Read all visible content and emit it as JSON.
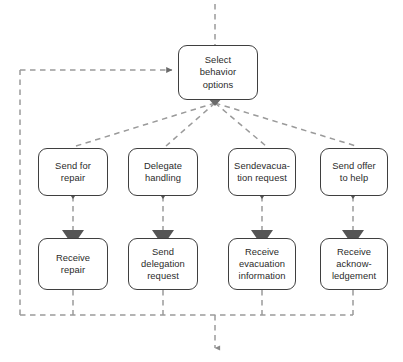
{
  "diagram": {
    "colors": {
      "node_border": "#3f3f3f",
      "node_fill": "#ffffff",
      "connector": "#9a9a9a",
      "arrowhead": "#555555",
      "text": "#2b2b2b"
    },
    "nodes": [
      {
        "id": "select-behavior-options",
        "label": "Select\nbehavior\noptions",
        "x": 178,
        "y": 45,
        "w": 80,
        "h": 55
      },
      {
        "id": "send-for-repair",
        "label": "Send for\nrepair",
        "x": 38,
        "y": 148,
        "w": 70,
        "h": 48
      },
      {
        "id": "delegate-handling",
        "label": "Delegate\nhandling",
        "x": 128,
        "y": 148,
        "w": 70,
        "h": 48
      },
      {
        "id": "send-evacuation-request",
        "label": "Sendevacua-\ntion request",
        "x": 228,
        "y": 148,
        "w": 68,
        "h": 48
      },
      {
        "id": "send-offer-to-help",
        "label": "Send offer\nto help",
        "x": 320,
        "y": 148,
        "w": 68,
        "h": 48
      },
      {
        "id": "receive-repair",
        "label": "Receive\nrepair",
        "x": 38,
        "y": 238,
        "w": 70,
        "h": 52
      },
      {
        "id": "send-delegation-request",
        "label": "Send\ndelegation\nrequest",
        "x": 128,
        "y": 238,
        "w": 70,
        "h": 52
      },
      {
        "id": "receive-evacuation-information",
        "label": "Receive\nevacuation\ninformation",
        "x": 228,
        "y": 238,
        "w": 68,
        "h": 52
      },
      {
        "id": "receive-acknowledgement",
        "label": "Receive\nacknow-\nledgement",
        "x": 320,
        "y": 238,
        "w": 68,
        "h": 52
      }
    ],
    "connectors": {
      "entry_from_top": "dashed line entering Select behavior options from above",
      "loop_back": "dashed line from bottom merge rail up the left side and right into Select behavior options",
      "fan_out": "four dashed diagonals from Select behavior options to the four row-2 nodes",
      "verticals": "dashed vertical with solid triangular arrowheads between row-2 and row-3 nodes",
      "merge_rail": "horizontal dashed rail collecting all four columns",
      "exit_arrow": "dashed arrow exiting downward from the merge rail"
    }
  }
}
